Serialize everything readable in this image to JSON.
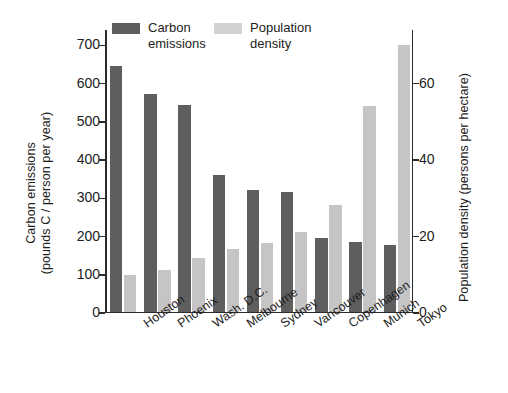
{
  "chart_data": {
    "type": "bar",
    "title": "",
    "subtitle": "",
    "xlabel": "",
    "ylabel": "Carbon emissions (pounds C / person per year)",
    "y2label": "Population density (persons per hectare)",
    "grid": false,
    "legend_position": "top-left",
    "ylim": [
      0,
      740
    ],
    "y2lim": [
      0,
      74
    ],
    "yticks": [
      0,
      100,
      200,
      300,
      400,
      500,
      600,
      700
    ],
    "y2ticks": [
      0,
      20,
      40,
      60
    ],
    "categories": [
      "Houston",
      "Phoenix",
      "Wash. D.C.",
      "Melbourne",
      "Sydney",
      "Vancouver",
      "Copenhagen",
      "Munich",
      "Tokyo"
    ],
    "series": [
      {
        "name": "Carbon emissions",
        "axis": "left",
        "unit": "pounds C / person per year",
        "color": "#5e5e5e",
        "values": [
          645,
          572,
          543,
          358,
          320,
          314,
          194,
          184,
          174
        ]
      },
      {
        "name": "Population density",
        "axis": "right",
        "unit": "persons per hectare",
        "color": "#c5c5c5",
        "values": [
          9.5,
          11,
          14,
          16.5,
          18,
          21,
          28,
          54,
          70
        ]
      }
    ]
  },
  "axes": {
    "left": {
      "title_line_1": "Carbon emissions",
      "title_line_2": "(pounds C / person per year)",
      "ticklabels": [
        "700",
        "600",
        "500",
        "400",
        "300",
        "200",
        "100",
        "0"
      ]
    },
    "right": {
      "title": "Population density (persons per hectare)",
      "ticklabels": [
        "60",
        "40",
        "20",
        "0"
      ]
    }
  },
  "legend": {
    "entries": [
      {
        "label": "Carbon\nemissions",
        "color": "#5e5e5e"
      },
      {
        "label": "Population\ndensity",
        "color": "#d2d2d2"
      }
    ]
  },
  "colors": {
    "carbon": "#5e5e5e",
    "density": "#c5c5c5",
    "axis": "#2b2b2b",
    "text": "#1d1d1d",
    "background": "#ffffff"
  }
}
